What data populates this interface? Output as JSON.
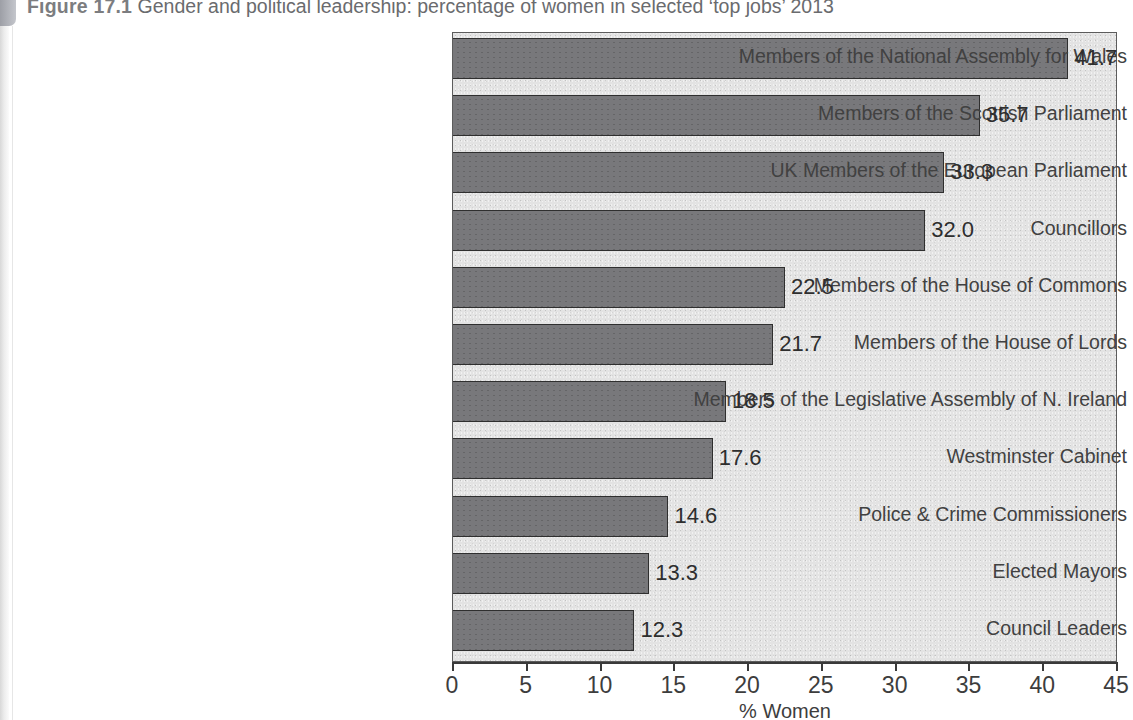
{
  "figure": {
    "number": "Figure 17.1",
    "caption": "Gender and political leadership: percentage of women in selected ‘top jobs’ 2013"
  },
  "colors": {
    "bar_fill": "#78787b",
    "bar_border": "#2f2f2f",
    "plot_background": "#e3e3e3",
    "axis": "#3a3a3a",
    "text": "#3d3d3d"
  },
  "chart_data": {
    "type": "bar",
    "orientation": "horizontal",
    "title": "Gender and political leadership: percentage of women in selected ‘top jobs’ 2013",
    "xlabel": "% Women",
    "ylabel": "",
    "xlim": [
      0,
      45
    ],
    "xticks": [
      0,
      5,
      10,
      15,
      20,
      25,
      30,
      35,
      40,
      45
    ],
    "grid": false,
    "legend": false,
    "data_labels": true,
    "categories": [
      "Members of the National Assembly for Wales",
      "Members of the Scottish Parliament",
      "UK Members of the European Parliament",
      "Councillors",
      "Members of the House of Commons",
      "Members of the House of Lords",
      "Members of the Legislative Assembly of N. Ireland",
      "Westminster Cabinet",
      "Police & Crime Commissioners",
      "Elected Mayors",
      "Council Leaders"
    ],
    "values": [
      41.7,
      35.7,
      33.3,
      32.0,
      22.5,
      21.7,
      18.5,
      17.6,
      14.6,
      13.3,
      12.3
    ],
    "value_labels": [
      "41.7",
      "35.7",
      "33.3",
      "32.0",
      "22.5",
      "21.7",
      "18.5",
      "17.6",
      "14.6",
      "13.3",
      "12.3"
    ]
  }
}
